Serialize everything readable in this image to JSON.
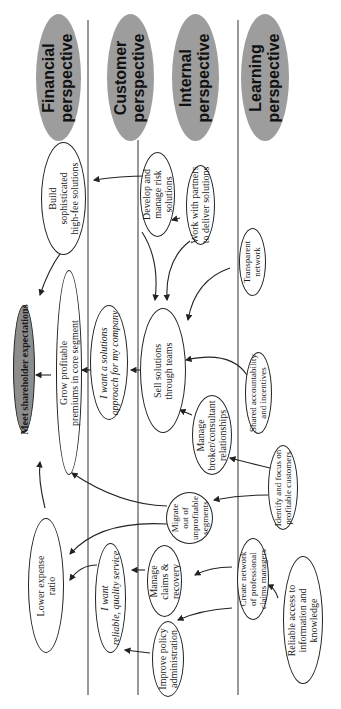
{
  "diagram": {
    "type": "strategy-map",
    "orientation": "rotated-90-ccw",
    "colors": {
      "header_fill": "#9d9d9d",
      "goal_fill": "#8d8d8d",
      "line": "#222222"
    },
    "perspectives": [
      {
        "id": "financial",
        "lines": [
          "Financial",
          "perspective"
        ]
      },
      {
        "id": "customer",
        "lines": [
          "Customer",
          "perspective"
        ]
      },
      {
        "id": "internal",
        "lines": [
          "Internal",
          "perspective"
        ]
      },
      {
        "id": "learning",
        "lines": [
          "Learning",
          "perspective"
        ]
      }
    ],
    "goal": {
      "id": "meet-shareholder",
      "lines": [
        "Meet shareholder expectations"
      ]
    },
    "nodes": {
      "build": {
        "lines": [
          "Build",
          "sophisticated",
          "high-fee solutions"
        ]
      },
      "grow": {
        "lines": [
          "Grow profitable",
          "premiums in core segment"
        ]
      },
      "lower": {
        "lines": [
          "Lower expense",
          "ratio"
        ]
      },
      "want_solutions": {
        "lines": [
          "I want a solutions",
          "approach for my company"
        ]
      },
      "want_reliable": {
        "lines": [
          "I want",
          "reliable, quality service"
        ]
      },
      "develop": {
        "lines": [
          "Develop and",
          "manage risk",
          "solutions"
        ]
      },
      "work_partners": {
        "lines": [
          "Work with partners",
          "to deliver solutions"
        ]
      },
      "sell": {
        "lines": [
          "Sell solutions",
          "through teams"
        ]
      },
      "manage_broker": {
        "lines": [
          "Manage",
          "broker/consultant",
          "relationships"
        ]
      },
      "migrate": {
        "lines": [
          "Migrate",
          "out of",
          "unprofitable",
          "segments"
        ]
      },
      "manage_claims": {
        "lines": [
          "Manage",
          "claims &",
          "recovery"
        ]
      },
      "improve_policy": {
        "lines": [
          "Improve policy",
          "administration"
        ]
      },
      "transparent": {
        "lines": [
          "Transparent",
          "network"
        ]
      },
      "shared": {
        "lines": [
          "Shared accountability",
          "and incentives"
        ]
      },
      "identify": {
        "lines": [
          "Identify and focus on",
          "profitable customers"
        ]
      },
      "create_network": {
        "lines": [
          "Create network",
          "of professional",
          "claims managers"
        ]
      },
      "reliable_access": {
        "lines": [
          "Reliable access to",
          "information and",
          "knowledge"
        ]
      }
    },
    "edges": [
      [
        "develop",
        "build"
      ],
      [
        "work_partners",
        "develop"
      ],
      [
        "build",
        "meet-shareholder"
      ],
      [
        "grow",
        "meet-shareholder"
      ],
      [
        "lower",
        "meet-shareholder"
      ],
      [
        "want_solutions",
        "grow"
      ],
      [
        "sell",
        "want_solutions"
      ],
      [
        "develop",
        "sell"
      ],
      [
        "work_partners",
        "sell"
      ],
      [
        "transparent",
        "sell"
      ],
      [
        "shared",
        "sell"
      ],
      [
        "manage_broker",
        "sell"
      ],
      [
        "identify",
        "manage_broker"
      ],
      [
        "identify",
        "migrate"
      ],
      [
        "migrate",
        "grow"
      ],
      [
        "migrate",
        "lower"
      ],
      [
        "want_reliable",
        "lower"
      ],
      [
        "manage_claims",
        "want_reliable"
      ],
      [
        "improve_policy",
        "want_reliable"
      ],
      [
        "create_network",
        "manage_claims"
      ],
      [
        "create_network",
        "improve_policy"
      ],
      [
        "reliable_access",
        "create_network"
      ]
    ]
  }
}
